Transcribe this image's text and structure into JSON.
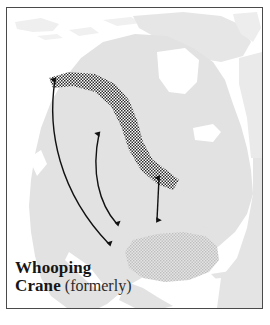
{
  "figure": {
    "kind": "range-map",
    "subject": "Whooping Crane",
    "region": "North America"
  },
  "caption": {
    "line1_bold": "Whooping",
    "line2_bold": "Crane",
    "line2_regular": "(formerly)"
  },
  "colors": {
    "land": "#e2e2e2",
    "land_edge": "#d6d6d6",
    "ocean": "#ffffff",
    "frame": "#4a4a4a",
    "arrow": "#111111",
    "breeding_hatch": "#2b2b2b",
    "wintering_hatch": "#b9b9b9",
    "caption_bold": "#161616",
    "caption_regular": "#2b2b2b"
  },
  "legend_features": [
    {
      "name": "breeding-range",
      "style": "dark-crosshatch",
      "label": "breeding range"
    },
    {
      "name": "wintering-range",
      "style": "light-crosshatch",
      "label": "wintering range"
    },
    {
      "name": "migration-route",
      "style": "double-headed-arrow",
      "label": "migration route"
    }
  ],
  "migration_arrows": [
    {
      "id": 1,
      "shape": "curved",
      "length": "long",
      "heads": "both",
      "from_y": 78,
      "to_y": 244
    },
    {
      "id": 2,
      "shape": "curved",
      "length": "medium",
      "heads": "both",
      "from_y": 132,
      "to_y": 224
    },
    {
      "id": 3,
      "shape": "straight",
      "length": "short",
      "heads": "both",
      "from_y": 176,
      "to_y": 219
    }
  ]
}
